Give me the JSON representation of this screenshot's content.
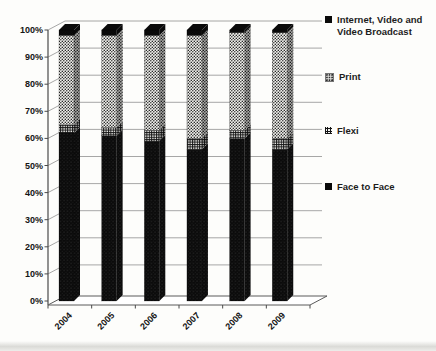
{
  "chart_data": {
    "type": "bar",
    "subtype": "stacked-100-percent-3d",
    "title": "",
    "xlabel": "",
    "ylabel": "",
    "categories": [
      "2004",
      "2005",
      "2006",
      "2007",
      "2008",
      "2009"
    ],
    "series": [
      {
        "name": "Face to Face",
        "pattern": "face",
        "values": [
          62,
          61,
          59,
          56,
          60,
          56
        ]
      },
      {
        "name": "Flexi",
        "pattern": "flexi",
        "values": [
          3,
          3,
          4,
          4,
          3,
          4
        ]
      },
      {
        "name": "Print",
        "pattern": "print",
        "values": [
          33,
          34,
          35,
          38,
          36,
          39
        ]
      },
      {
        "name": "Internet, Video and Video Broadcast",
        "pattern": "internet",
        "values": [
          2,
          2,
          2,
          2,
          1,
          1
        ]
      }
    ],
    "y_ticks": [
      "0%",
      "10%",
      "20%",
      "30%",
      "40%",
      "50%",
      "60%",
      "70%",
      "80%",
      "90%",
      "100%"
    ],
    "ylim": [
      0,
      100
    ],
    "grid": true,
    "legend_position": "right",
    "colors": {
      "segment_black": "#0a0a0a",
      "grid_line": "#909090",
      "axis_line": "#4a4a4a",
      "wall_fill": "#ffffff"
    }
  },
  "legend": {
    "items": [
      {
        "label": "Internet, Video and Video Broadcast",
        "marker": "internet"
      },
      {
        "label": "Print",
        "marker": "print"
      },
      {
        "label": "Flexi",
        "marker": "flexi"
      },
      {
        "label": "Face to Face",
        "marker": "face"
      }
    ]
  }
}
